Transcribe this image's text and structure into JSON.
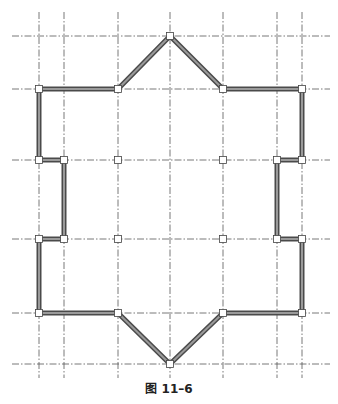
{
  "figure": {
    "caption": "图 11–6",
    "colors": {
      "gridline": "#555555",
      "wall_outer": "#4a4a4a",
      "wall_inner": "#9a9a9a",
      "node_fill": "#ffffff",
      "node_stroke": "#444444"
    },
    "grid": {
      "vertical_x": [
        39,
        64,
        118,
        170,
        223,
        277,
        302
      ],
      "horizontal_y": [
        36,
        89,
        160,
        239,
        313,
        364
      ],
      "v_extent": [
        12,
        378
      ],
      "h_extent": [
        12,
        330
      ]
    },
    "walls": [
      [
        170,
        36
      ],
      [
        223,
        89
      ],
      [
        302,
        89
      ],
      [
        302,
        160
      ],
      [
        277,
        160
      ],
      [
        277,
        239
      ],
      [
        302,
        239
      ],
      [
        302,
        313
      ],
      [
        223,
        313
      ],
      [
        170,
        364
      ],
      [
        118,
        313
      ],
      [
        39,
        313
      ],
      [
        39,
        239
      ],
      [
        64,
        239
      ],
      [
        64,
        160
      ],
      [
        39,
        160
      ],
      [
        39,
        89
      ],
      [
        118,
        89
      ]
    ],
    "nodes": [
      [
        170,
        36
      ],
      [
        118,
        89
      ],
      [
        223,
        89
      ],
      [
        39,
        89
      ],
      [
        302,
        89
      ],
      [
        39,
        160
      ],
      [
        64,
        160
      ],
      [
        118,
        160
      ],
      [
        223,
        160
      ],
      [
        277,
        160
      ],
      [
        302,
        160
      ],
      [
        39,
        239
      ],
      [
        64,
        239
      ],
      [
        118,
        239
      ],
      [
        223,
        239
      ],
      [
        277,
        239
      ],
      [
        302,
        239
      ],
      [
        39,
        313
      ],
      [
        118,
        313
      ],
      [
        223,
        313
      ],
      [
        302,
        313
      ],
      [
        170,
        364
      ]
    ]
  }
}
